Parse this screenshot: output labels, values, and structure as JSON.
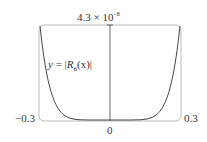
{
  "chart_data": {
    "type": "line",
    "title": "",
    "function_label": "y = |R6(x)|",
    "xlabel": "",
    "ylabel": "",
    "x_ticks": [
      "−0.3",
      "0",
      "0.3"
    ],
    "y_max_label": "4.3 × 10⁻⁸",
    "xlim": [
      -0.3,
      0.3
    ],
    "ylim": [
      0,
      4.3e-08
    ],
    "grid": false,
    "series": [
      {
        "name": "y = |R6(x)|",
        "x": [
          -0.3,
          -0.275,
          -0.25,
          -0.225,
          -0.2,
          -0.15,
          -0.1,
          -0.05,
          0,
          0.05,
          0.1,
          0.15,
          0.2,
          0.225,
          0.25,
          0.275,
          0.3
        ],
        "y": [
          4.3e-08,
          2.34e-08,
          1.2e-08,
          5.7e-09,
          2.5e-09,
          3.3e-10,
          2e-11,
          1.5e-13,
          0,
          1.5e-13,
          2e-11,
          3.3e-10,
          2.5e-09,
          5.7e-09,
          1.2e-08,
          2.34e-08,
          4.3e-08
        ]
      }
    ]
  },
  "labels": {
    "top": "4.3 × 10",
    "top_exp": "−8",
    "left": "−0.3",
    "right": "0.3",
    "origin": "0",
    "func_y": "y",
    "func_eq": " = |",
    "func_R": "R",
    "func_sub": "6",
    "func_arg": "(x)|"
  }
}
